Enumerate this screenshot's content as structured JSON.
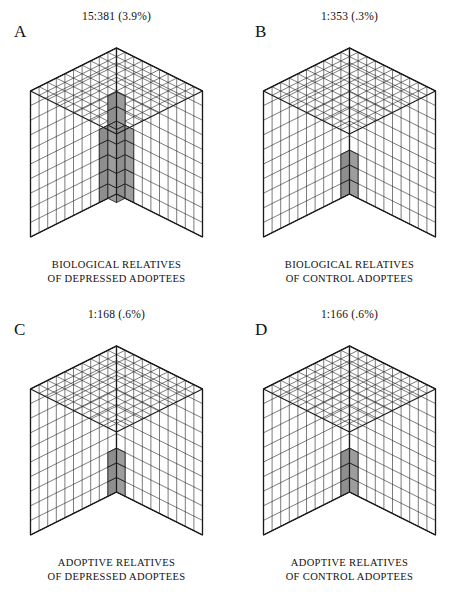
{
  "figure": {
    "type": "isometric-cube-proportion-diagram",
    "grid_units_per_edge": 10,
    "total_units_per_cube": 1000,
    "colors": {
      "shaded_top": "#a8a8a8",
      "shaded_left": "#8e8e8e",
      "shaded_right": "#9d9d9d",
      "outline": "#1a1a1a",
      "grid_line": "#2b2b2b",
      "background": "#ffffff"
    }
  },
  "panels": [
    {
      "letter": "A",
      "ratio": "15:381 (3.9%)",
      "caption_line1": "BIOLOGICAL RELATIVES",
      "caption_line2": "OF DEPRESSED ADOPTEES",
      "affected": 15,
      "total": 381,
      "percent": 3.9,
      "shaded_shape": "stepped-stack"
    },
    {
      "letter": "B",
      "ratio": "1:353 (.3%)",
      "caption_line1": "BIOLOGICAL RELATIVES",
      "caption_line2": "OF CONTROL ADOPTEES",
      "affected": 1,
      "total": 353,
      "percent": 0.3,
      "shaded_shape": "single-column"
    },
    {
      "letter": "C",
      "ratio": "1:168 (.6%)",
      "caption_line1": "ADOPTIVE RELATIVES",
      "caption_line2": "OF DEPRESSED ADOPTEES",
      "affected": 1,
      "total": 168,
      "percent": 0.6,
      "shaded_shape": "corner-column"
    },
    {
      "letter": "D",
      "ratio": "1:166 (.6%)",
      "caption_line1": "ADOPTIVE RELATIVES",
      "caption_line2": "OF CONTROL ADOPTEES",
      "affected": 1,
      "total": 166,
      "percent": 0.6,
      "shaded_shape": "corner-column"
    }
  ],
  "chart_data": {
    "type": "bar",
    "categories": [
      "Biological relatives of depressed adoptees",
      "Biological relatives of control adoptees",
      "Adoptive relatives of depressed adoptees",
      "Adoptive relatives of control adoptees"
    ],
    "panel_letters": [
      "A",
      "B",
      "C",
      "D"
    ],
    "values": [
      3.9,
      0.3,
      0.6,
      0.6
    ],
    "numerators": [
      15,
      1,
      1,
      1
    ],
    "denominators": [
      381,
      353,
      168,
      166
    ],
    "ratio_labels": [
      "15:381 (3.9%)",
      "1:353 (.3%)",
      "1:168 (.6%)",
      "1:166 (.6%)"
    ],
    "xlabel": "",
    "ylabel": "Percent affected (%)",
    "ylim": [
      0,
      4
    ],
    "grid": false,
    "legend": "none"
  }
}
